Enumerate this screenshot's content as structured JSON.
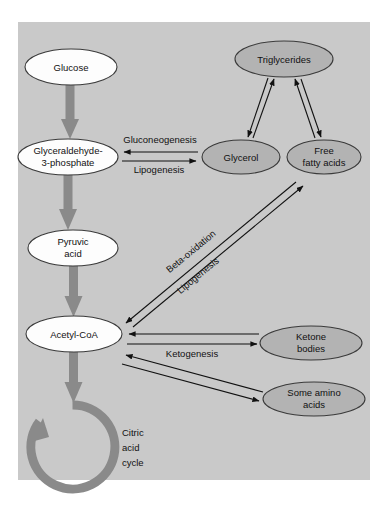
{
  "figure": {
    "background_color": "#c9c9c9",
    "page_color": "#ffffff",
    "node_white_fill": "#fdfdfd",
    "node_gray_fill": "#b3b3b3",
    "arrow_gray": "#8a8a8a",
    "arrow_black": "#111111"
  },
  "nodes": {
    "glucose": {
      "label": "Glucose",
      "style": "white"
    },
    "g3p_line1": {
      "label": "Glyceraldehyde-",
      "style": "white"
    },
    "g3p_line2": {
      "label": "3-phosphate",
      "style": "white"
    },
    "pyruvic_line1": {
      "label": "Pyruvic",
      "style": "white"
    },
    "pyruvic_line2": {
      "label": "acid",
      "style": "white"
    },
    "acetyl_coa": {
      "label": "Acetyl-CoA",
      "style": "white"
    },
    "triglycerides": {
      "label": "Triglycerides",
      "style": "gray"
    },
    "glycerol": {
      "label": "Glycerol",
      "style": "gray"
    },
    "free_fatty_acids_line1": {
      "label": "Free",
      "style": "gray"
    },
    "free_fatty_acids_line2": {
      "label": "fatty acids",
      "style": "gray"
    },
    "ketone_bodies_line1": {
      "label": "Ketone",
      "style": "gray"
    },
    "ketone_bodies_line2": {
      "label": "bodies",
      "style": "gray"
    },
    "some_amino_acids_line1": {
      "label": "Some amino",
      "style": "gray"
    },
    "some_amino_acids_line2": {
      "label": "acids",
      "style": "gray"
    }
  },
  "pathway_labels": {
    "gluconeogenesis": "Gluconeogenesis",
    "lipogenesis_horizontal": "Lipogenesis",
    "beta_oxidation": "Beta-oxidation",
    "lipogenesis_diagonal": "Lipogenesis",
    "ketogenesis": "Ketogenesis"
  },
  "cycle": {
    "line1": "Citric",
    "line2": "acid",
    "line3": "cycle"
  }
}
